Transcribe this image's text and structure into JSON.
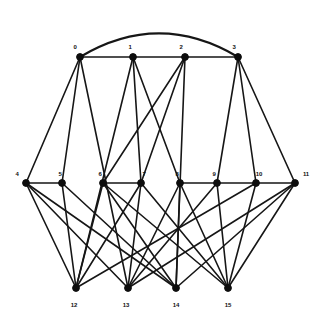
{
  "figure": {
    "background_color": "#ffffff",
    "edge_color": "#161616",
    "node_color": "#0d0d0d",
    "label_color": "#111111"
  },
  "chart_data": {
    "type": "diagram",
    "subtype": "node-link-graph",
    "title": "",
    "directed": false,
    "node_count": 16,
    "edge_count": 32,
    "layout": "three-row layered drawing with one curved arc",
    "rows": [
      {
        "name": "top-row",
        "labels": [
          "0",
          "1",
          "2",
          "3"
        ]
      },
      {
        "name": "middle-row",
        "labels": [
          "4",
          "5",
          "6",
          "7",
          "8",
          "9",
          "10",
          "11"
        ]
      },
      {
        "name": "bottom-row",
        "labels": [
          "12",
          "13",
          "14",
          "15"
        ]
      }
    ],
    "nodes": [
      {
        "id": 0,
        "label": "0",
        "x": 80,
        "y": 57,
        "label_x": 75,
        "label_y": 47
      },
      {
        "id": 1,
        "label": "1",
        "x": 133,
        "y": 57,
        "label_x": 130,
        "label_y": 47
      },
      {
        "id": 2,
        "label": "2",
        "x": 185,
        "y": 57,
        "label_x": 181,
        "label_y": 47
      },
      {
        "id": 3,
        "label": "3",
        "x": 238,
        "y": 57,
        "label_x": 234,
        "label_y": 47
      },
      {
        "id": 4,
        "label": "4",
        "x": 26,
        "y": 183,
        "label_x": 17,
        "label_y": 174
      },
      {
        "id": 5,
        "label": "5",
        "x": 62,
        "y": 183,
        "label_x": 60,
        "label_y": 174
      },
      {
        "id": 6,
        "label": "6",
        "x": 103,
        "y": 183,
        "label_x": 100,
        "label_y": 174
      },
      {
        "id": 7,
        "label": "7",
        "x": 141,
        "y": 183,
        "label_x": 144,
        "label_y": 174
      },
      {
        "id": 8,
        "label": "8",
        "x": 180,
        "y": 183,
        "label_x": 177,
        "label_y": 174
      },
      {
        "id": 9,
        "label": "9",
        "x": 217,
        "y": 183,
        "label_x": 214,
        "label_y": 174
      },
      {
        "id": 10,
        "label": "10",
        "x": 256,
        "y": 183,
        "label_x": 259,
        "label_y": 174
      },
      {
        "id": 11,
        "label": "11",
        "x": 295,
        "y": 183,
        "label_x": 306,
        "label_y": 174
      },
      {
        "id": 12,
        "label": "12",
        "x": 76,
        "y": 288,
        "label_x": 74,
        "label_y": 305
      },
      {
        "id": 13,
        "label": "13",
        "x": 128,
        "y": 288,
        "label_x": 126,
        "label_y": 305
      },
      {
        "id": 14,
        "label": "14",
        "x": 176,
        "y": 288,
        "label_x": 176,
        "label_y": 305
      },
      {
        "id": 15,
        "label": "15",
        "x": 228,
        "y": 288,
        "label_x": 228,
        "label_y": 305
      }
    ],
    "edges": [
      {
        "source": 0,
        "target": 1,
        "type": "straight"
      },
      {
        "source": 1,
        "target": 2,
        "type": "straight"
      },
      {
        "source": 2,
        "target": 3,
        "type": "straight"
      },
      {
        "source": 0,
        "target": 3,
        "type": "arc",
        "arc_peak_y": 16
      },
      {
        "source": 0,
        "target": 4,
        "type": "straight"
      },
      {
        "source": 0,
        "target": 5,
        "type": "straight"
      },
      {
        "source": 0,
        "target": 13,
        "type": "straight"
      },
      {
        "source": 1,
        "target": 7,
        "type": "straight"
      },
      {
        "source": 1,
        "target": 8,
        "type": "straight"
      },
      {
        "source": 1,
        "target": 12,
        "type": "straight"
      },
      {
        "source": 2,
        "target": 6,
        "type": "straight"
      },
      {
        "source": 2,
        "target": 7,
        "type": "straight"
      },
      {
        "source": 2,
        "target": 14,
        "type": "straight"
      },
      {
        "source": 3,
        "target": 9,
        "type": "straight"
      },
      {
        "source": 3,
        "target": 10,
        "type": "straight"
      },
      {
        "source": 3,
        "target": 11,
        "type": "straight"
      },
      {
        "source": 4,
        "target": 5,
        "type": "straight"
      },
      {
        "source": 4,
        "target": 12,
        "type": "straight"
      },
      {
        "source": 4,
        "target": 13,
        "type": "straight"
      },
      {
        "source": 4,
        "target": 14,
        "type": "straight"
      },
      {
        "source": 5,
        "target": 12,
        "type": "straight"
      },
      {
        "source": 5,
        "target": 14,
        "type": "straight"
      },
      {
        "source": 6,
        "target": 7,
        "type": "straight"
      },
      {
        "source": 6,
        "target": 12,
        "type": "straight"
      },
      {
        "source": 6,
        "target": 14,
        "type": "straight"
      },
      {
        "source": 6,
        "target": 15,
        "type": "straight"
      },
      {
        "source": 7,
        "target": 12,
        "type": "straight"
      },
      {
        "source": 7,
        "target": 13,
        "type": "straight"
      },
      {
        "source": 7,
        "target": 15,
        "type": "straight"
      },
      {
        "source": 8,
        "target": 9,
        "type": "straight"
      },
      {
        "source": 8,
        "target": 13,
        "type": "straight"
      },
      {
        "source": 8,
        "target": 14,
        "type": "straight"
      },
      {
        "source": 8,
        "target": 15,
        "type": "straight"
      },
      {
        "source": 9,
        "target": 10,
        "type": "straight"
      },
      {
        "source": 9,
        "target": 13,
        "type": "straight"
      },
      {
        "source": 9,
        "target": 15,
        "type": "straight"
      },
      {
        "source": 10,
        "target": 11,
        "type": "straight"
      },
      {
        "source": 10,
        "target": 12,
        "type": "straight"
      },
      {
        "source": 10,
        "target": 15,
        "type": "straight"
      },
      {
        "source": 11,
        "target": 13,
        "type": "straight"
      },
      {
        "source": 11,
        "target": 14,
        "type": "straight"
      },
      {
        "source": 11,
        "target": 15,
        "type": "straight"
      }
    ]
  }
}
